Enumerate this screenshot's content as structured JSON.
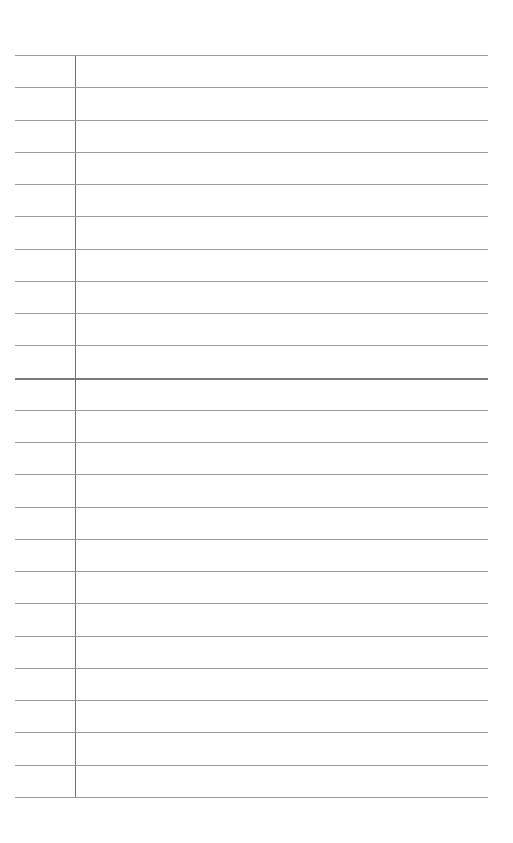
{
  "page": {
    "type": "lined-paper",
    "background": "#ffffff",
    "rule_color": "#9a9a9a",
    "margin_line_color": "#6f6f6f",
    "rule_count": 24,
    "first_rule_y": 55,
    "rule_spacing": 32.26,
    "thick_rule_index": 10,
    "margin_x": 75
  }
}
